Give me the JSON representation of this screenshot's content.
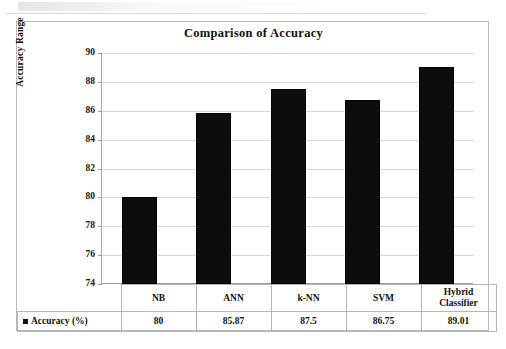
{
  "figure": {
    "title": "Comparison of Accuracy",
    "y_axis_title": "Accuracy Range",
    "legend_label": "Accuracy (%)",
    "bar_color": "#0d0d0d",
    "gridline_color": "#d7d7d7"
  },
  "chart_data": {
    "type": "bar",
    "title": "Comparison of Accuracy",
    "xlabel": "",
    "ylabel": "Accuracy Range",
    "ylim": [
      74,
      90
    ],
    "ytick_step": 2,
    "yticks": [
      90,
      88,
      86,
      84,
      82,
      80,
      78,
      76,
      74
    ],
    "grid": true,
    "legend": "Accuracy (%)",
    "legend_position": "bottom-table",
    "categories": [
      "NB",
      "ANN",
      "k-NN",
      "SVM",
      "Hybrid Classifier"
    ],
    "values": [
      80,
      85.87,
      87.5,
      86.75,
      89.01
    ],
    "value_labels": [
      "80",
      "85.87",
      "87.5",
      "86.75",
      "89.01"
    ],
    "series": [
      {
        "name": "Accuracy (%)",
        "values": [
          80,
          85.87,
          87.5,
          86.75,
          89.01
        ]
      }
    ]
  },
  "table": {
    "category_row": [
      "NB",
      "ANN",
      "k-NN",
      "SVM",
      "Hybrid Classifier"
    ],
    "category_row_wrapped": [
      "NB",
      "ANN",
      "k-NN",
      "SVM",
      "Hybrid\nClassifier"
    ],
    "value_row": [
      "80",
      "85.87",
      "87.5",
      "86.75",
      "89.01"
    ],
    "row_header": "Accuracy (%)"
  }
}
